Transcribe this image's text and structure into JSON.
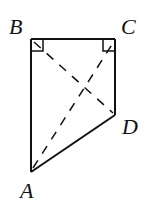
{
  "diagram": {
    "type": "quadrilateral",
    "vertices": [
      {
        "name": "A",
        "label": "A"
      },
      {
        "name": "B",
        "label": "B"
      },
      {
        "name": "C",
        "label": "C"
      },
      {
        "name": "D",
        "label": "D"
      }
    ],
    "sides": [
      "AB",
      "BC",
      "CD",
      "DA"
    ],
    "dashed_lines": [
      "AC",
      "BD"
    ],
    "right_angles": [
      "B",
      "C"
    ],
    "colors": {
      "stroke": "#111111",
      "background": "#ffffff"
    }
  }
}
